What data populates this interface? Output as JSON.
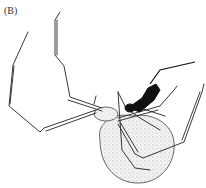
{
  "figure": {
    "panel_label": "(B)",
    "colors": {
      "ink": "#1a1a1a",
      "abdomen_fill": "#e6e6e6",
      "background": "#ffffff"
    }
  }
}
